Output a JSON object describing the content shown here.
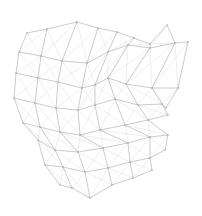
{
  "diagram": {
    "type": "wireframe-mesh",
    "background": "#ffffff",
    "edge_color": "#b4b4b4",
    "diagonal_color": "#dcdcdc",
    "rows": [
      [
        [
          27,
          33
        ],
        [
          47,
          29
        ],
        [
          77,
          22
        ],
        [
          98,
          28
        ],
        [
          117,
          32
        ],
        [
          134,
          38
        ],
        [
          150,
          44
        ],
        [
          167,
          25
        ]
      ],
      [
        [
          19,
          52
        ],
        [
          41,
          56
        ],
        [
          62,
          61
        ],
        [
          87,
          63
        ],
        [
          108,
          52
        ],
        [
          128,
          45
        ],
        [
          150,
          48
        ],
        [
          175,
          43
        ],
        [
          188,
          42
        ]
      ],
      [
        [
          16,
          73
        ],
        [
          38,
          78
        ],
        [
          58,
          82
        ],
        [
          82,
          88
        ],
        [
          95,
          85
        ],
        [
          108,
          78
        ],
        [
          126,
          84
        ],
        [
          152,
          88
        ],
        [
          178,
          88
        ]
      ],
      [
        [
          14,
          98
        ],
        [
          35,
          103
        ],
        [
          56,
          108
        ],
        [
          78,
          110
        ],
        [
          95,
          105
        ],
        [
          115,
          99
        ],
        [
          138,
          105
        ],
        [
          162,
          104
        ],
        [
          166,
          108
        ]
      ],
      [
        [
          23,
          123
        ],
        [
          40,
          127
        ],
        [
          60,
          132
        ],
        [
          80,
          135
        ],
        [
          100,
          130
        ],
        [
          125,
          125
        ],
        [
          148,
          120
        ],
        [
          168,
          115
        ]
      ],
      [
        [
          38,
          140
        ],
        [
          55,
          150
        ],
        [
          78,
          152
        ],
        [
          103,
          148
        ],
        [
          128,
          143
        ],
        [
          150,
          137
        ],
        [
          168,
          135
        ]
      ],
      [
        [
          45,
          165
        ],
        [
          63,
          167
        ],
        [
          85,
          172
        ],
        [
          108,
          168
        ],
        [
          130,
          162
        ],
        [
          150,
          158
        ],
        [
          165,
          150
        ]
      ],
      [
        [
          60,
          185
        ],
        [
          72,
          188
        ],
        [
          90,
          198
        ],
        [
          112,
          185
        ],
        [
          133,
          178
        ],
        [
          152,
          170
        ]
      ]
    ]
  }
}
